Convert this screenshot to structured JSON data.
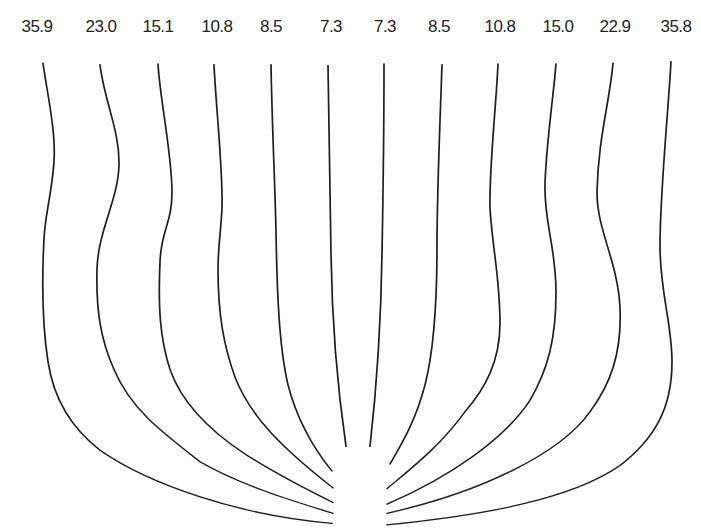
{
  "diagram": {
    "type": "streamline-profile-lines",
    "line_color": "#1e1e1e",
    "background": "#ffffff",
    "labels": [
      {
        "text": "35.9",
        "x": 37
      },
      {
        "text": "23.0",
        "x": 101
      },
      {
        "text": "15.1",
        "x": 158
      },
      {
        "text": "10.8",
        "x": 217
      },
      {
        "text": "8.5",
        "x": 271
      },
      {
        "text": "7.3",
        "x": 331
      },
      {
        "text": "7.3",
        "x": 385
      },
      {
        "text": "8.5",
        "x": 439
      },
      {
        "text": "10.8",
        "x": 500
      },
      {
        "text": "15.0",
        "x": 558
      },
      {
        "text": "22.9",
        "x": 615
      },
      {
        "text": "35.8",
        "x": 676
      }
    ],
    "curves": [
      {
        "label": "35.9",
        "d": "M43,82 C47,120 56,170 54,210 C52,250 45,280 44,310 C42,360 42,420 48,470 C55,530 80,565 100,585 C150,630 240,670 332,680"
      },
      {
        "label": "23.0",
        "d": "M100,84 C104,130 120,170 119,215 C118,260 98,300 97,350 C96,400 100,440 114,480 C130,530 160,560 200,600 C240,630 290,650 333,667"
      },
      {
        "label": "15.1",
        "d": "M158,83 C160,130 172,200 172,250 C172,290 161,300 160,340 C158,400 160,440 170,480 C182,525 210,560 245,590 C275,615 305,635 333,653"
      },
      {
        "label": "10.8",
        "d": "M214,84 C216,140 223,220 222,270 C221,300 218,320 218,350 C218,410 224,450 235,490 C250,540 280,580 333,634"
      },
      {
        "label": "8.5",
        "d": "M271,84 C272,160 275,240 276,300 C277,380 279,450 288,500 C298,550 315,585 332,612"
      },
      {
        "label": "7.3",
        "d": "M328,85 C329,180 330,260 331,330 C332,420 337,500 346,580"
      },
      {
        "label": "7.3",
        "d": "M384,83 C384,180 383,260 382,330 C381,420 377,500 370,580"
      },
      {
        "label": "8.5",
        "d": "M442,84 C440,160 437,250 437,320 C437,400 433,460 425,500 C415,550 400,580 390,603"
      },
      {
        "label": "10.8",
        "d": "M498,83 C496,140 489,220 490,270 C492,320 500,360 500,420 C500,470 485,505 465,535 C440,580 410,610 387,635"
      },
      {
        "label": "15.0",
        "d": "M556,83 C553,130 546,190 545,240 C544,290 556,320 556,380 C556,440 548,480 530,520 C505,570 450,620 387,655"
      },
      {
        "label": "22.9",
        "d": "M613,82 C610,130 598,180 597,250 C597,300 618,340 620,400 C622,460 610,500 590,535 C560,590 480,640 387,667"
      },
      {
        "label": "35.8",
        "d": "M671,80 C668,150 660,250 660,320 C660,380 672,420 672,470 C672,530 655,570 620,605 C570,650 480,670 387,682"
      }
    ]
  }
}
